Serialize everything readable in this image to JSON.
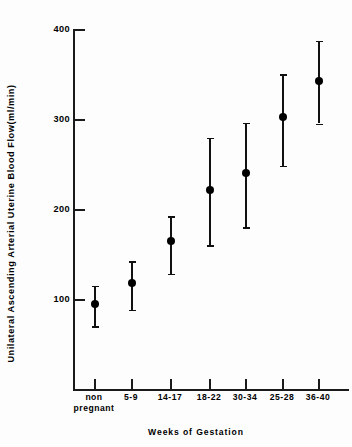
{
  "chart_data": {
    "type": "scatter",
    "title": "",
    "xlabel": "Weeks of Gestation",
    "ylabel": "Unilateral Ascending Arterial Uterine Blood Flow(ml/min)",
    "ylim": [
      0,
      400
    ],
    "yticks": [
      100,
      200,
      300,
      400
    ],
    "ytick_labels": [
      "100",
      "200",
      "300",
      "400"
    ],
    "grid": false,
    "legend": "none",
    "error_bars": "vertical with caps",
    "marker": "filled-circle",
    "categories": [
      "non pregnant",
      "5-9",
      "14-17",
      "18-22",
      "30-34",
      "25-28",
      "36-40"
    ],
    "category_labels_line1": [
      "non",
      "5-9",
      "14-17",
      "18-22",
      "30-34",
      "25-28",
      "36-40"
    ],
    "category_labels_line2": [
      "pregnant",
      "",
      "",
      "",
      "",
      "",
      ""
    ],
    "values": [
      95,
      118,
      165,
      221,
      240,
      302,
      342
    ],
    "err_low": [
      70,
      88,
      128,
      160,
      180,
      248,
      295
    ],
    "err_high": [
      115,
      142,
      192,
      279,
      296,
      350,
      387
    ],
    "points": [
      {
        "category": "non pregnant",
        "mean": 95,
        "low": 70,
        "high": 115
      },
      {
        "category": "5-9",
        "mean": 118,
        "low": 88,
        "high": 142
      },
      {
        "category": "14-17",
        "mean": 165,
        "low": 128,
        "high": 192
      },
      {
        "category": "18-22",
        "mean": 221,
        "low": 160,
        "high": 279
      },
      {
        "category": "30-34",
        "mean": 240,
        "low": 180,
        "high": 296
      },
      {
        "category": "25-28",
        "mean": 302,
        "low": 248,
        "high": 350
      },
      {
        "category": "36-40",
        "mean": 342,
        "low": 295,
        "high": 387
      }
    ],
    "colors": {
      "marker": "#000000",
      "errorbar": "#111111",
      "axis": "#1a1a1a",
      "background": "#fdfdfd"
    }
  }
}
